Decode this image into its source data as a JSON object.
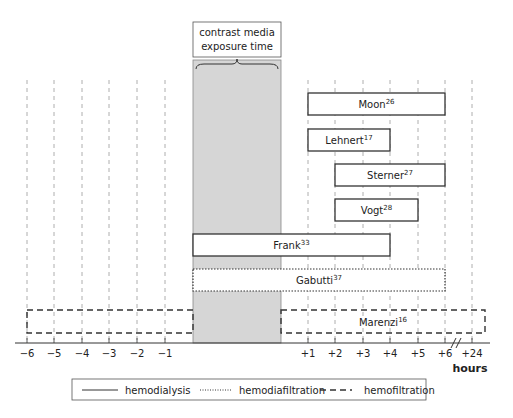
{
  "title_box": {
    "line1": "contrast media",
    "line2": "exposure time"
  },
  "exposure_window": {
    "start_hour": 0,
    "end_hour": 0,
    "fill": "#d6d6d6"
  },
  "axis": {
    "unit_label": "hours",
    "ticks_before": [
      "−6",
      "−5",
      "−4",
      "−3",
      "−2",
      "−1"
    ],
    "ticks_after": [
      "+1",
      "+2",
      "+3",
      "+4",
      "+5",
      "+6",
      "+24"
    ],
    "break_between": [
      "+6",
      "+24"
    ]
  },
  "studies": [
    {
      "name": "Moon",
      "ref": "26",
      "start": "+1",
      "end": "+6",
      "method": "hemodialysis"
    },
    {
      "name": "Lehnert",
      "ref": "17",
      "start": "+1",
      "end": "+4",
      "method": "hemodialysis"
    },
    {
      "name": "Sterner",
      "ref": "27",
      "start": "+2",
      "end": "+6",
      "method": "hemodialysis"
    },
    {
      "name": "Vogt",
      "ref": "28",
      "start": "+2",
      "end": "+5",
      "method": "hemodialysis"
    },
    {
      "name": "Frank",
      "ref": "33",
      "start": "during",
      "end": "+4",
      "method": "hemodialysis"
    },
    {
      "name": "Gabutti",
      "ref": "37",
      "start": "during",
      "end": "+6",
      "method": "hemodiafiltration"
    },
    {
      "name": "Marenzi",
      "ref": "16",
      "start": "−6",
      "end": "+24",
      "method": "hemofiltration"
    }
  ],
  "legend": [
    {
      "style": "solid",
      "label": "hemodialysis"
    },
    {
      "style": "dotted",
      "label": "hemodiafiltration"
    },
    {
      "style": "dashed",
      "label": "hemofiltration"
    }
  ]
}
